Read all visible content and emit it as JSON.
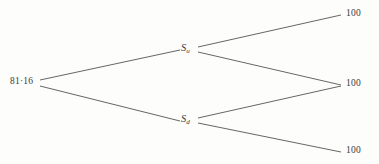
{
  "diagram": {
    "background_color": "#fdfdfc",
    "line_color": "#555555",
    "text_color": "#3a3a3a",
    "root": {
      "label": "81·16",
      "value": "81.16",
      "x": 22,
      "y": 82
    },
    "states": [
      {
        "id": "up",
        "base": "S",
        "subscript": "u",
        "x": 188,
        "y": 49
      },
      {
        "id": "down",
        "base": "S",
        "subscript": "d",
        "x": 188,
        "y": 120
      }
    ],
    "payoffs": [
      {
        "id": "uu",
        "label": "100",
        "x": 346,
        "y": 15
      },
      {
        "id": "ud",
        "label": "100",
        "x": 346,
        "y": 85
      },
      {
        "id": "dd",
        "label": "100",
        "x": 346,
        "y": 152
      }
    ],
    "edges": [
      {
        "id": "root-to-up",
        "x1": 40,
        "y1": 80,
        "x2": 180,
        "y2": 50
      },
      {
        "id": "root-to-down",
        "x1": 40,
        "y1": 86,
        "x2": 180,
        "y2": 121
      },
      {
        "id": "up-to-uu",
        "x1": 198,
        "y1": 47,
        "x2": 341,
        "y2": 15
      },
      {
        "id": "up-to-ud",
        "x1": 198,
        "y1": 52,
        "x2": 341,
        "y2": 85
      },
      {
        "id": "down-to-ud",
        "x1": 198,
        "y1": 118,
        "x2": 341,
        "y2": 86
      },
      {
        "id": "down-to-dd",
        "x1": 198,
        "y1": 123,
        "x2": 341,
        "y2": 152
      }
    ]
  }
}
